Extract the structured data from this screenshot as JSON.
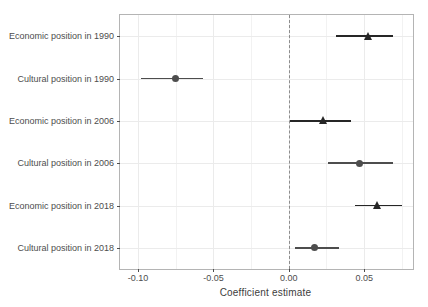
{
  "chart_data": {
    "type": "scatter",
    "subtype": "coefficient-plot",
    "title": "",
    "xlabel": "Coefficient estimate",
    "ylabel": "",
    "xlim": [
      -0.112,
      0.0824
    ],
    "xticks": [
      -0.1,
      -0.05,
      0.0,
      0.05
    ],
    "xtick_labels": [
      "-0.10",
      "-0.05",
      "0.00",
      "0.05"
    ],
    "grid": true,
    "legend": false,
    "reference_line": {
      "x": 0.0,
      "style": "dashed",
      "color": "#8c8c8c"
    },
    "categories": [
      "Economic position in 1990",
      "Cultural position in 1990",
      "Economic position in 2006",
      "Cultural position in 2006",
      "Economic position in 2018",
      "Cultural position in 2018"
    ],
    "points": [
      {
        "label": "Economic position in 1990",
        "estimate": 0.053,
        "ci_low": 0.031,
        "ci_high": 0.069,
        "marker": "triangle",
        "color": "#262626"
      },
      {
        "label": "Cultural position in 1990",
        "estimate": -0.075,
        "ci_low": -0.098,
        "ci_high": -0.057,
        "marker": "circle",
        "color": "#4d4d4d"
      },
      {
        "label": "Economic position in 2006",
        "estimate": 0.023,
        "ci_low": 0.001,
        "ci_high": 0.041,
        "marker": "triangle",
        "color": "#262626"
      },
      {
        "label": "Cultural position in 2006",
        "estimate": 0.047,
        "ci_low": 0.026,
        "ci_high": 0.069,
        "marker": "circle",
        "color": "#4d4d4d"
      },
      {
        "label": "Economic position in 2018",
        "estimate": 0.059,
        "ci_low": 0.044,
        "ci_high": 0.075,
        "marker": "triangle",
        "color": "#262626"
      },
      {
        "label": "Cultural position in 2018",
        "estimate": 0.017,
        "ci_low": 0.004,
        "ci_high": 0.033,
        "marker": "circle",
        "color": "#4d4d4d"
      }
    ]
  },
  "colors": {
    "panel_border": "#b4b4b4",
    "gridline": "#ebebeb",
    "zero_line": "#8c8c8c",
    "tick_text": "#4d4d4d",
    "background": "#ffffff"
  }
}
